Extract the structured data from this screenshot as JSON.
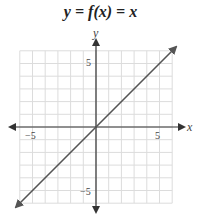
{
  "title": "y = f(x) = x",
  "chart_data": {
    "type": "line",
    "title": "y = f(x) = x",
    "xlabel": "x",
    "ylabel": "y",
    "xlim": [
      -6,
      6
    ],
    "ylim": [
      -6,
      6
    ],
    "grid": true,
    "tick_labels": {
      "x": [
        "−5",
        "5"
      ],
      "y": [
        "5",
        "−5"
      ]
    },
    "series": [
      {
        "name": "f(x) = x",
        "x": [
          -6,
          6
        ],
        "y": [
          -6,
          6
        ],
        "arrows": "both"
      }
    ],
    "colors": {
      "line": "#555555",
      "grid": "#dddddd",
      "axes": "#333333"
    }
  }
}
